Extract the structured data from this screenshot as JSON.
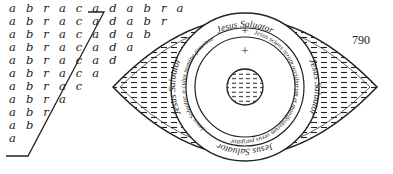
{
  "figure": {
    "number": "790",
    "abracadabra_triangle": [
      "abracadabra",
      "abracadabr",
      "abracadab",
      "abracada",
      "abracad",
      "abraca",
      "abrac",
      "abra",
      "abr",
      "ab",
      "a"
    ],
    "eye": {
      "outer_ring_text_left": "Jesus Saluator",
      "outer_ring_text_top": "Jesus Saluator",
      "outer_ring_text_right": "Jesus Saluator",
      "outer_ring_text_bottom": "Jesus Saluator",
      "inner_ring_text_left": "Jesus Saluator, o cuius nomine precioso",
      "inner_ring_cross": "+",
      "inner_ring_text_right": "Jesus sciens rerum occultarum et manifestarum verus purgator",
      "iris_cross": "+"
    },
    "colors": {
      "ink": "#222222",
      "background": "#ffffff"
    }
  }
}
